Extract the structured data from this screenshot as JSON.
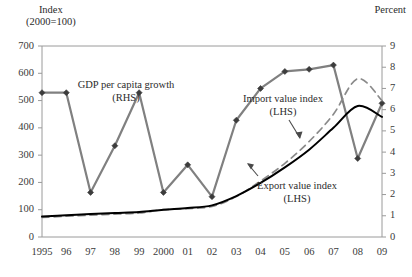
{
  "chart_data": {
    "type": "line",
    "title": "",
    "categories": [
      "1995",
      "96",
      "97",
      "98",
      "99",
      "2000",
      "01",
      "02",
      "03",
      "04",
      "05",
      "06",
      "07",
      "08",
      "09"
    ],
    "x_values": [
      1995,
      1996,
      1997,
      1998,
      1999,
      2000,
      2001,
      2002,
      2003,
      2004,
      2005,
      2006,
      2007,
      2008,
      2009
    ],
    "xlabel": "",
    "grid": false,
    "legend_position": "inline-annotations",
    "axes": {
      "left": {
        "title_line1": "Index",
        "title_line2": "(2000=100)",
        "label": "Index (2000=100)",
        "min": 0,
        "max": 700,
        "ticks": [
          0,
          100,
          200,
          300,
          400,
          500,
          600,
          700
        ],
        "tick_labels": [
          "0",
          "100",
          "200",
          "300",
          "400",
          "500",
          "600",
          "700"
        ]
      },
      "right": {
        "title": "Percent",
        "label": "Percent",
        "min": 0,
        "max": 9,
        "ticks": [
          0,
          1,
          2,
          3,
          4,
          5,
          6,
          7,
          8,
          9
        ],
        "tick_labels": [
          "0",
          "1",
          "2",
          "3",
          "4",
          "5",
          "6",
          "7",
          "8",
          "9"
        ]
      }
    },
    "series": [
      {
        "name": "GDP per capita growth",
        "label_line1": "GDP per capita growth",
        "label_line2": "(RHS)",
        "axis": "right",
        "style": "solid-markers",
        "color": "#808080",
        "marker": "diamond",
        "values": [
          6.8,
          6.8,
          2.1,
          4.3,
          6.8,
          2.1,
          3.4,
          1.9,
          5.5,
          7.0,
          7.8,
          7.9,
          8.1,
          3.7,
          6.3
        ]
      },
      {
        "name": "Import value index",
        "label_line1": "Import value index",
        "label_line2": "(LHS)",
        "axis": "left",
        "style": "dashed",
        "color": "#8a8a8a",
        "marker": "none",
        "values": [
          72,
          76,
          80,
          84,
          88,
          100,
          104,
          112,
          148,
          205,
          270,
          350,
          450,
          580,
          500
        ]
      },
      {
        "name": "Export value index",
        "label_line1": "Export value index",
        "label_line2": "(LHS)",
        "axis": "left",
        "style": "solid",
        "color": "#000000",
        "marker": "none",
        "values": [
          75,
          80,
          84,
          88,
          92,
          100,
          106,
          116,
          150,
          198,
          255,
          320,
          400,
          480,
          440
        ]
      }
    ],
    "annotations": [
      {
        "text": "GDP per capita growth (RHS)",
        "target_series": "GDP per capita growth"
      },
      {
        "text": "Import value index (LHS)",
        "target_series": "Import value index",
        "has_arrow": true
      },
      {
        "text": "Export value index (LHS)",
        "target_series": "Export value index",
        "has_arrow": true
      }
    ]
  },
  "colors": {
    "gdp_line": "#808080",
    "import_line": "#8a8a8a",
    "export_line": "#000000",
    "axis": "#8c8c8c",
    "text": "#2b2b2b",
    "background": "#ffffff"
  }
}
